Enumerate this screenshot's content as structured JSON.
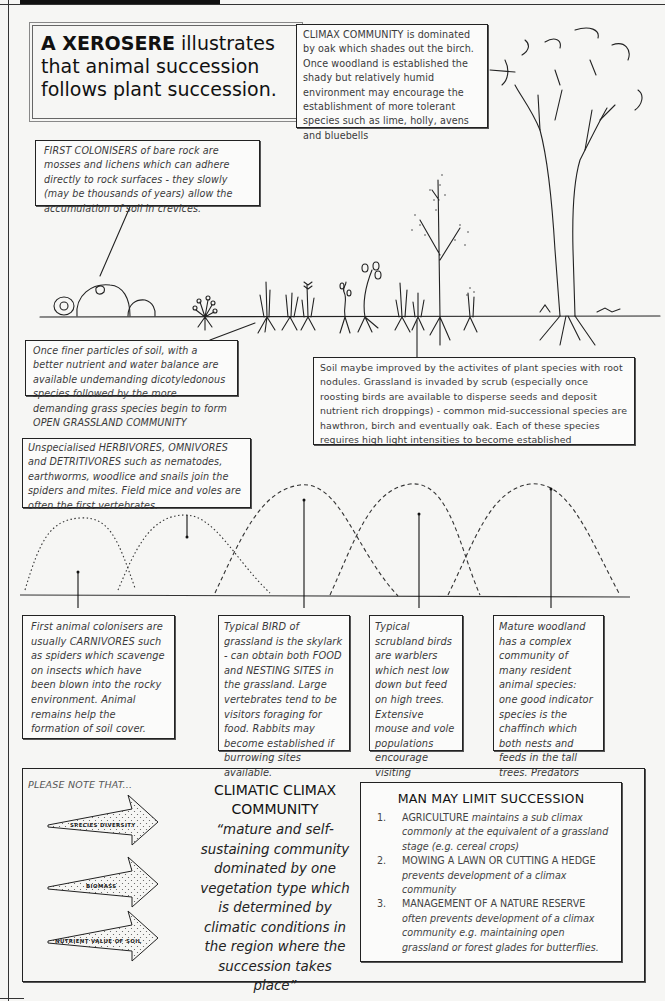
{
  "title": {
    "bold": "A XEROSERE",
    "rest": " illustrates that animal succession follows plant succession."
  },
  "plant_stages": {
    "climax": "CLIMAX COMMUNITY is dominated by oak which shades out the birch. Once woodland is established the shady but relatively humid environment may encourage the establishment of more tolerant species such as lime, holly, avens and bluebells",
    "first_colonisers": "FIRST COLONISERS of bare rock are mosses and lichens which can adhere directly to rock surfaces - they slowly (may be thousands of years) allow the accumulation of soil in crevices.",
    "finer_particles": "Once finer particles of soil, with a better nutrient and water balance are available undemanding dicotyledonous species followed by the more demanding grass species begin to form OPEN GRASSLAND COMMUNITY",
    "soil_improved": "Soil maybe improved by      the activites of plant species with root nodules. Grassland is invaded by scrub (especially once roosting birds are available to disperse seeds and deposit nutrient rich droppings) - common mid-successional species are hawthron, birch and eventually oak. Each of these species requires high light intensities to become established"
  },
  "animal_stages": {
    "herbivores": "Unspecialised HERBIVORES, OMNIVORES and DETRITIVORES such as nematodes, earthworms, woodlice and snails join the spiders and mites. Field mice and voles are often the first vertebrates.",
    "carnivores": "First animal colonisers are usually CARNIVORES such as spiders which scavenge on insects which have been blown into the rocky environment. Animal remains help the formation of soil cover.",
    "grassland_bird": "Typical BIRD of grassland is the skylark - can obtain both FOOD and NESTING SITES in the grassland. Large vertebrates tend to be visitors foraging for food. Rabbits may become established if burrowing sites available.",
    "scrubland_birds": "Typical scrubland birds are warblers which nest low down but feed on high trees. Extensive mouse and vole populations encourage visiting predators such as hen harrier and short-eared owl.",
    "woodland": "Mature woodland has a complex community of many resident animal species: one good indicator species is the chaffinch which both nests and feeds in the tall trees. Predators such as fox, sparrowhawk and tawny owl may now be resident."
  },
  "note": {
    "label": "PLEASE NOTE THAT...",
    "arrows": [
      "SPECIES DIVERSITY",
      "BIOMASS",
      "NUTRIENT VALUE OF SOIL"
    ]
  },
  "climatic": {
    "title": "CLIMATIC CLIMAX COMMUNITY",
    "quote": "“mature and self-sustaining community dominated by one vegetation type which is determined by climatic conditions in the region where the succession takes place”"
  },
  "man": {
    "title": "MAN MAY LIMIT SUCCESSION",
    "items": [
      {
        "num": "1.",
        "caps": "AGRICULTURE",
        "text": " maintains a sub climax commonly at the equivalent of a grassland stage (e.g. cereal crops)"
      },
      {
        "num": "2.",
        "caps": "MOWING A LAWN OR CUTTING A HEDGE",
        "text": " prevents development of a climax community"
      },
      {
        "num": "3.",
        "caps": "MANAGEMENT OF A NATURE RESERVE",
        "text": " often prevents development of a climax community e.g. maintaining open grassland or forest glades for butterflies."
      }
    ]
  }
}
